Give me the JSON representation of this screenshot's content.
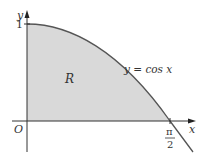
{
  "figure": {
    "y_axis_label": "y",
    "x_axis_label": "x",
    "origin_label": "O",
    "y_tick_label": "1",
    "x_tick_numerator": "π",
    "x_tick_denominator": "2",
    "region_label": "R",
    "curve_label": "y = cos x",
    "colors": {
      "region_fill": "#d9d9d9",
      "curve": "#555555",
      "axes": "#333333"
    }
  }
}
